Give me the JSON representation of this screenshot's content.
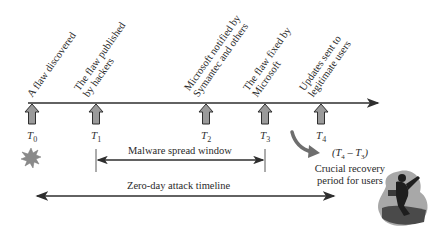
{
  "diagram": {
    "type": "timeline",
    "colors": {
      "line": "#2e2e2e",
      "arrow_fill": "#9a9a9a",
      "arrow_stroke": "#2e2e2e",
      "curved_arrow": "#6e6e6e",
      "starburst": "#8a8a8a",
      "text": "#2a2a2a"
    },
    "events": [
      {
        "id": "T0",
        "time_label": "T",
        "subscript": "0",
        "line1": "A flaw discovered",
        "line2": ""
      },
      {
        "id": "T1",
        "time_label": "T",
        "subscript": "1",
        "line1": "The flaw published",
        "line2": "by hackers"
      },
      {
        "id": "T2",
        "time_label": "T",
        "subscript": "2",
        "line1": "Microsoft notified by",
        "line2": "Symantec and others"
      },
      {
        "id": "T3",
        "time_label": "T",
        "subscript": "3",
        "line1": "The flaw fixed by",
        "line2": "Microsoft"
      },
      {
        "id": "T4",
        "time_label": "T",
        "subscript": "4",
        "line1": "Updates sent to",
        "line2": "legitimate users"
      }
    ],
    "spans": {
      "malware_window": {
        "label": "Malware spread window",
        "from": "T1",
        "to": "T3"
      },
      "zero_day": {
        "label": "Zero-day attack timeline",
        "from": "T0",
        "to": "T4+"
      }
    },
    "recovery": {
      "formula": "(T4 − T3)",
      "formula_parts": {
        "open": "(",
        "a": "T",
        "a_sub": "4",
        "minus": " – ",
        "b": "T",
        "b_sub": "3",
        "close": ")"
      },
      "line1": "Crucial recovery",
      "line2": "period for users"
    },
    "icons": {
      "start": "starburst-icon",
      "end": "running-person-icon",
      "recovery_pointer": "curved-arrow-icon"
    }
  }
}
